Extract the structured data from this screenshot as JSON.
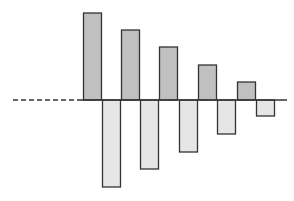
{
  "chart_data": {
    "type": "bar",
    "title": "",
    "xlabel": "",
    "ylabel": "",
    "grid": false,
    "legend": null,
    "baseline": {
      "y_px": 100,
      "dashed_from_px": 13,
      "solid_from_px": 82,
      "end_px": 287,
      "stroke": "#333333"
    },
    "colors": {
      "positive_fill": "#c0c0c0",
      "negative_fill": "#e6e6e6",
      "stroke": "#333333"
    },
    "categories": [
      "1",
      "2",
      "3",
      "4",
      "5"
    ],
    "series": [
      {
        "name": "positive",
        "values": [
          87,
          70,
          53,
          35,
          18
        ],
        "x_px": [
          83,
          121,
          159,
          198,
          237
        ],
        "width_px": 19
      },
      {
        "name": "negative",
        "values": [
          -87,
          -69,
          -52,
          -34,
          -16
        ],
        "x_px": [
          102,
          140,
          179,
          217,
          256
        ],
        "width_px": 19
      }
    ],
    "ylim": [
      -90,
      90
    ],
    "annotations": []
  }
}
